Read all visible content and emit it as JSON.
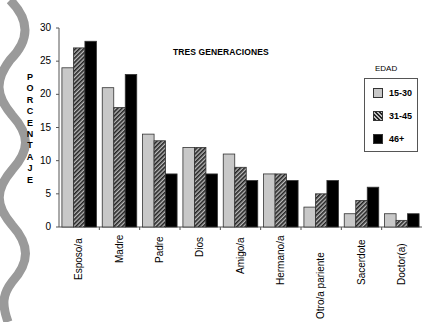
{
  "chart_data": {
    "type": "bar",
    "title": "TRES GENERACIONES",
    "xlabel": "",
    "ylabel": "PORCENTAJE",
    "ylim": [
      0,
      30
    ],
    "yticks": [
      0,
      5,
      10,
      15,
      20,
      25,
      30
    ],
    "grid": false,
    "legend_title": "EDAD",
    "legend_position": "right",
    "categories": [
      "Esposo/a",
      "Madre",
      "Padre",
      "Dios",
      "Amigo/a",
      "Hermano/a",
      "Otro/a pariente",
      "Sacerdote",
      "Doctor(a)"
    ],
    "series": [
      {
        "name": "15-30",
        "fill": "light-gray",
        "values": [
          24,
          21,
          14,
          12,
          11,
          8,
          3,
          2,
          2
        ]
      },
      {
        "name": "31-45",
        "fill": "hatched",
        "values": [
          27,
          18,
          13,
          12,
          9,
          8,
          5,
          4,
          1
        ]
      },
      {
        "name": "46+",
        "fill": "black",
        "values": [
          28,
          23,
          8,
          8,
          7,
          7,
          7,
          6,
          2
        ]
      }
    ]
  },
  "ylabel_letters": [
    "P",
    "O",
    "R",
    "C",
    "E",
    "N",
    "T",
    "A",
    "J",
    "E"
  ],
  "colors": {
    "light": "#c8c8c8",
    "hatch_dark": "#222222",
    "black": "#000000",
    "axis": "#555555",
    "wave": "#9a9a9a"
  }
}
